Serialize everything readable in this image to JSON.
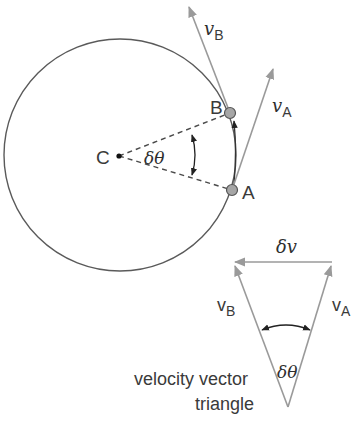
{
  "diagram": {
    "colors": {
      "circle": "#5a5a5a",
      "vector": "#9a9a9a",
      "dashed": "#4a4a4a",
      "dot_fill": "#a6a6a6",
      "text": "#3a3a3a"
    },
    "circle": {
      "center_label": "C",
      "angle_label": "δθ",
      "points": [
        {
          "label": "B",
          "vector_label": "v",
          "vector_sub": "B"
        },
        {
          "label": "A",
          "vector_label": "v",
          "vector_sub": "A"
        }
      ]
    },
    "triangle": {
      "top_label": "δv",
      "left_label": "v",
      "left_sub": "B",
      "right_label": "v",
      "right_sub": "A",
      "angle_label": "δθ",
      "caption_line1": "velocity vector",
      "caption_line2": "triangle"
    }
  }
}
